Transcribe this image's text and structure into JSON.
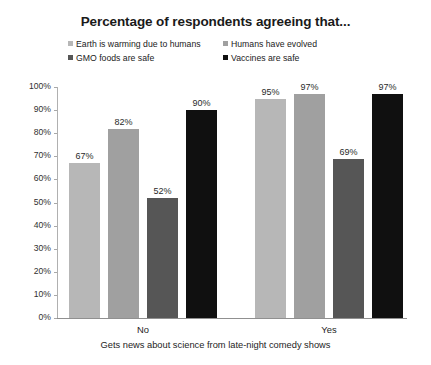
{
  "chart_data": {
    "type": "bar",
    "title": "Percentage of respondents agreeing that...",
    "xlabel": "Gets news about science from late-night comedy shows",
    "ylabel": "",
    "categories": [
      "No",
      "Yes"
    ],
    "ylim": [
      0,
      100
    ],
    "ytick_labels": [
      "100%",
      "90%",
      "80%",
      "70%",
      "60%",
      "50%",
      "40%",
      "30%",
      "20%",
      "10%",
      "0%"
    ],
    "ytick_values": [
      100,
      90,
      80,
      70,
      60,
      50,
      40,
      30,
      20,
      10,
      0
    ],
    "grid": false,
    "legend_position": "top",
    "series": [
      {
        "name": "Earth is warming due to humans",
        "color": "#b7b7b7",
        "values": [
          67,
          95
        ],
        "labels": [
          "67%",
          "95%"
        ]
      },
      {
        "name": "Humans have evolved",
        "color": "#a0a0a0",
        "values": [
          82,
          97
        ],
        "labels": [
          "82%",
          "97%"
        ]
      },
      {
        "name": "GMO foods are safe",
        "color": "#565656",
        "values": [
          52,
          69
        ],
        "labels": [
          "52%",
          "69%"
        ]
      },
      {
        "name": "Vaccines are safe",
        "color": "#101010",
        "values": [
          90,
          97
        ],
        "labels": [
          "90%",
          "97%"
        ]
      }
    ]
  }
}
